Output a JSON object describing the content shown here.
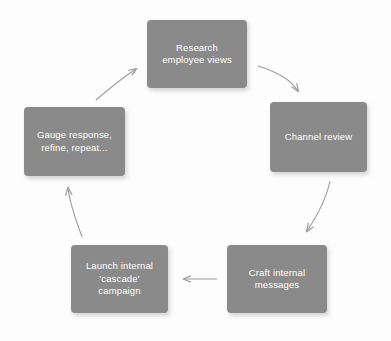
{
  "diagram": {
    "type": "cycle-process-diagram",
    "background_color": "#fdfdfd",
    "node_fill_color": "#8a8a8a",
    "node_text_color": "#ffffff",
    "arrow_color": "#9a9a9a",
    "nodes": [
      {
        "id": "research-employee-views",
        "label": "Research\nemployee views",
        "x": 147,
        "y": 20,
        "width": 100,
        "height": 68
      },
      {
        "id": "channel-review",
        "label": "Channel review",
        "x": 270,
        "y": 102,
        "width": 97,
        "height": 70
      },
      {
        "id": "craft-internal-messages",
        "label": "Craft internal\nmessages",
        "x": 227,
        "y": 245,
        "width": 100,
        "height": 68
      },
      {
        "id": "launch-internal-cascade-campaign",
        "label": "Launch internal\n'cascade'\ncampaign",
        "x": 71,
        "y": 245,
        "width": 97,
        "height": 68
      },
      {
        "id": "gauge-response-refine-repeat",
        "label": "Gauge response,\nrefine, repeat...",
        "x": 24,
        "y": 107,
        "width": 101,
        "height": 69
      }
    ],
    "arrows": [
      {
        "id": "arrow-research-to-channel",
        "from": "research-employee-views",
        "to": "channel-review",
        "direction": "clockwise-curve-down-right"
      },
      {
        "id": "arrow-channel-to-craft",
        "from": "channel-review",
        "to": "craft-internal-messages",
        "direction": "clockwise-curve-down"
      },
      {
        "id": "arrow-craft-to-launch",
        "from": "craft-internal-messages",
        "to": "launch-internal-cascade-campaign",
        "direction": "straight-left"
      },
      {
        "id": "arrow-launch-to-gauge",
        "from": "launch-internal-cascade-campaign",
        "to": "gauge-response-refine-repeat",
        "direction": "clockwise-curve-up"
      },
      {
        "id": "arrow-gauge-to-research",
        "from": "gauge-response-refine-repeat",
        "to": "research-employee-views",
        "direction": "clockwise-curve-up-right"
      }
    ]
  }
}
